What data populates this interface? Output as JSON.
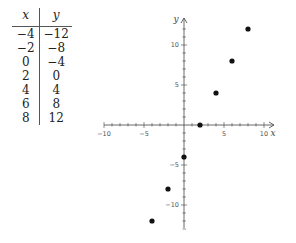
{
  "table": {
    "headers": [
      "x",
      "y"
    ],
    "rows": [
      [
        "−4",
        "−12"
      ],
      [
        "−2",
        "−8"
      ],
      [
        "0",
        "−4"
      ],
      [
        "2",
        "0"
      ],
      [
        "4",
        "4"
      ],
      [
        "6",
        "8"
      ],
      [
        "8",
        "12"
      ]
    ]
  },
  "chart_data": {
    "type": "scatter",
    "title": "",
    "xlabel": "x",
    "ylabel": "y",
    "x": [
      -4,
      -2,
      0,
      2,
      4,
      6,
      8
    ],
    "y": [
      -12,
      -8,
      -4,
      0,
      4,
      8,
      12
    ],
    "xlim": [
      -10,
      11
    ],
    "ylim": [
      -13,
      13
    ],
    "x_ticks": [
      -10,
      -5,
      5,
      10
    ],
    "y_ticks": [
      -10,
      -5,
      5,
      10
    ],
    "grid": false,
    "point_color": "#111111"
  }
}
